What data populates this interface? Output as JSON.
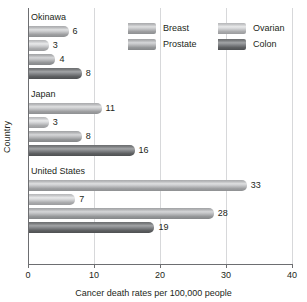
{
  "chart_data": {
    "type": "bar",
    "orientation": "horizontal",
    "title": "",
    "xlabel": "Cancer death rates per 100,000 people",
    "ylabel": "Country",
    "xlim": [
      0,
      40
    ],
    "xticks": [
      "0",
      "10",
      "20",
      "30",
      "40"
    ],
    "grid": true,
    "legend_position": "top-right",
    "categories": [
      "Okinawa",
      "Japan",
      "United States"
    ],
    "series": [
      {
        "name": "Breast",
        "values": [
          6,
          11,
          33
        ]
      },
      {
        "name": "Ovarian",
        "values": [
          3,
          3,
          7
        ]
      },
      {
        "name": "Prostate",
        "values": [
          4,
          8,
          28
        ]
      },
      {
        "name": "Colon",
        "values": [
          8,
          16,
          19
        ]
      }
    ],
    "groups": [
      {
        "label": "Okinawa",
        "bars": [
          {
            "series": "Breast",
            "value": 6,
            "value_label": "6"
          },
          {
            "series": "Ovarian",
            "value": 3,
            "value_label": "3"
          },
          {
            "series": "Prostate",
            "value": 4,
            "value_label": "4"
          },
          {
            "series": "Colon",
            "value": 8,
            "value_label": "8"
          }
        ]
      },
      {
        "label": "Japan",
        "bars": [
          {
            "series": "Breast",
            "value": 11,
            "value_label": "11"
          },
          {
            "series": "Ovarian",
            "value": 3,
            "value_label": "3"
          },
          {
            "series": "Prostate",
            "value": 8,
            "value_label": "8"
          },
          {
            "series": "Colon",
            "value": 16,
            "value_label": "16"
          }
        ]
      },
      {
        "label": "United States",
        "bars": [
          {
            "series": "Breast",
            "value": 33,
            "value_label": "33"
          },
          {
            "series": "Ovarian",
            "value": 7,
            "value_label": "7"
          },
          {
            "series": "Prostate",
            "value": 28,
            "value_label": "28"
          },
          {
            "series": "Colon",
            "value": 19,
            "value_label": "19"
          }
        ]
      }
    ],
    "legend": [
      {
        "label": "Breast",
        "swatch": "breast",
        "color": "#c6c7c9"
      },
      {
        "label": "Prostate",
        "swatch": "prostate",
        "color": "#bdbec0"
      },
      {
        "label": "Ovarian",
        "swatch": "ovarian",
        "color": "#d2d3d5"
      },
      {
        "label": "Colon",
        "swatch": "colon",
        "color": "#85878a"
      }
    ],
    "colors": {
      "axis": "#6d6e71",
      "grid": "#d7d8da",
      "text": "#231f20",
      "background": "#ffffff"
    }
  }
}
